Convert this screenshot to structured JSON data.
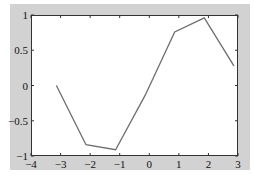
{
  "figure": {
    "background_color": "#d2d2d2",
    "axes_background_color": "#ffffff",
    "line_color": "#6e6e6e",
    "axis_color": "#333333"
  },
  "chart_data": {
    "type": "line",
    "title": "",
    "xlabel": "",
    "ylabel": "",
    "xlim": [
      -4,
      3
    ],
    "ylim": [
      -1,
      1
    ],
    "grid": false,
    "legend": null,
    "x_ticks": [
      -4,
      -3,
      -2,
      -1,
      0,
      1,
      2,
      3
    ],
    "x_tick_labels": [
      "-4",
      "-3",
      "-2",
      "-1",
      "0",
      "1",
      "2",
      "3"
    ],
    "y_ticks": [
      -1,
      -0.5,
      0,
      0.5,
      1
    ],
    "y_tick_labels": [
      "-1",
      "-0.5",
      "0",
      "0.5",
      "1"
    ],
    "series": [
      {
        "name": "sin(x)",
        "x": [
          -3.14,
          -2.14,
          -1.14,
          -0.14,
          0.86,
          1.86,
          2.86
        ],
        "y": [
          0.0,
          -0.84,
          -0.91,
          -0.14,
          0.76,
          0.96,
          0.28
        ]
      }
    ]
  }
}
